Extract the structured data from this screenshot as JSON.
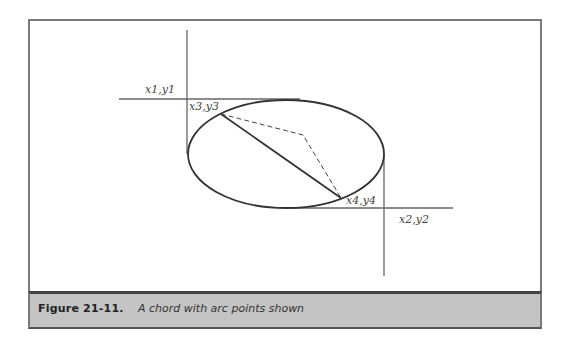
{
  "figure": {
    "number_label": "Figure  21-11.",
    "caption": "A chord with arc points shown"
  },
  "labels": {
    "p1": "x1,y1",
    "p2": "x2,y2",
    "p3": "x3,y3",
    "p4": "x4,y4"
  },
  "colors": {
    "caption_bg": "#c4c4c4",
    "frame": "#7a7a7a",
    "line": "#333333"
  }
}
